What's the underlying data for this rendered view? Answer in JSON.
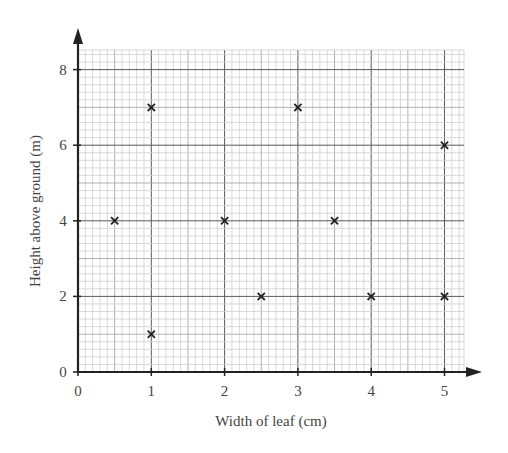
{
  "chart_data": {
    "type": "scatter",
    "title": "",
    "xlabel": "Width of leaf (cm)",
    "ylabel": "Height above ground (m)",
    "xlim": [
      0,
      5.27
    ],
    "ylim": [
      0,
      8.5
    ],
    "x_ticks": [
      0,
      1,
      2,
      3,
      4,
      5
    ],
    "y_ticks": [
      0,
      2,
      4,
      6,
      8
    ],
    "x_tick_labels": [
      "0",
      "1",
      "2",
      "3",
      "4",
      "5"
    ],
    "y_tick_labels": [
      "0",
      "2",
      "4",
      "6",
      "8"
    ],
    "grid": true,
    "grid_minor_x": 0.1,
    "grid_minor_y": 0.2,
    "marker": "x",
    "legend": null,
    "series": [
      {
        "name": "leaves",
        "points": [
          {
            "x": 0.5,
            "y": 4
          },
          {
            "x": 1,
            "y": 7
          },
          {
            "x": 1,
            "y": 1
          },
          {
            "x": 2,
            "y": 4
          },
          {
            "x": 2.5,
            "y": 2
          },
          {
            "x": 3,
            "y": 7
          },
          {
            "x": 3.5,
            "y": 4
          },
          {
            "x": 4,
            "y": 2
          },
          {
            "x": 5,
            "y": 6
          },
          {
            "x": 5,
            "y": 2
          }
        ]
      }
    ]
  },
  "colors": {
    "axis": "#222222",
    "grid_minor": "#cfcfcf",
    "grid_mid": "#a8a8a8",
    "grid_major": "#5a5a5a",
    "marker": "#222222",
    "text": "#444444"
  }
}
